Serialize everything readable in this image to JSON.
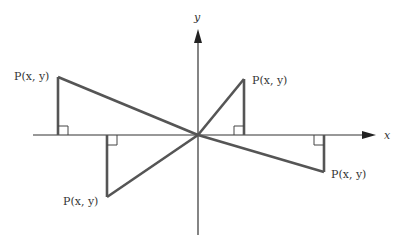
{
  "diagram": {
    "title": "",
    "axes": {
      "x_label": "x",
      "y_label": "y"
    },
    "points": [
      {
        "quadrant": "II",
        "label": "P(x, y)"
      },
      {
        "quadrant": "I",
        "label": "P(x, y)"
      },
      {
        "quadrant": "III",
        "label": "P(x, y)"
      },
      {
        "quadrant": "IV",
        "label": "P(x, y)"
      }
    ],
    "colors": {
      "axis": "#333333",
      "segment": "#555555",
      "text": "#333333"
    }
  }
}
